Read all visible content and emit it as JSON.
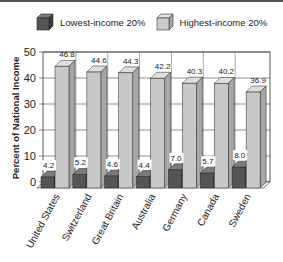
{
  "chart_data": {
    "type": "bar",
    "title": "",
    "xlabel": "",
    "ylabel": "Percent of National Income",
    "ylim": [
      0,
      50
    ],
    "yticks": [
      0,
      10,
      20,
      30,
      40,
      50
    ],
    "grid": true,
    "legend_position": "top",
    "categories": [
      "United States",
      "Switzerland",
      "Great Britain",
      "Australia",
      "Germany",
      "Canada",
      "Sweden"
    ],
    "series": [
      {
        "name": "Lowest-income 20%",
        "values": [
          4.2,
          5.2,
          4.6,
          4.4,
          7.0,
          5.7,
          8.0
        ],
        "color": "#5a5a5a"
      },
      {
        "name": "Highest-income 20%",
        "values": [
          46.8,
          44.6,
          44.3,
          42.2,
          40.3,
          40.2,
          36.9
        ],
        "color": "#c8c8c8"
      }
    ]
  },
  "legend": {
    "low_label": "Lowest-income 20%",
    "high_label": "Highest-income 20%"
  }
}
